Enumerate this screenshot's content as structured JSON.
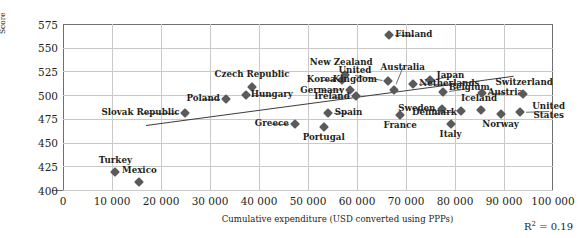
{
  "chart_data": {
    "type": "scatter",
    "title": "",
    "xlabel": "Cumulative expenditure (USD converted using PPPs)",
    "ylabel": "Score",
    "xlim": [
      0,
      100000
    ],
    "ylim": [
      400,
      575
    ],
    "xticks": [
      "0",
      "10 000",
      "20 000",
      "30 000",
      "40 000",
      "50 000",
      "60 000",
      "70 000",
      "80 000",
      "90 000",
      "100 000"
    ],
    "xtick_values": [
      0,
      10000,
      20000,
      30000,
      40000,
      50000,
      60000,
      70000,
      80000,
      90000,
      100000
    ],
    "yticks": [
      "400",
      "425",
      "450",
      "475",
      "500",
      "525",
      "550",
      "575"
    ],
    "ytick_values": [
      400,
      425,
      450,
      475,
      500,
      525,
      550,
      575
    ],
    "grid": true,
    "legend": "none",
    "annotation": "R2 = 0.19",
    "r_squared": 0.19,
    "trendline": {
      "x0": 17000,
      "y0": 468,
      "x1": 92000,
      "y1": 520
    },
    "points": [
      {
        "label": "Turkey",
        "x": 10700,
        "y": 419,
        "label_dx": 0,
        "label_dy": -11
      },
      {
        "label": "Mexico",
        "x": 15600,
        "y": 409,
        "label_dx": 0,
        "label_dy": -11
      },
      {
        "label": "Slovak Republic",
        "x": 24800,
        "y": 481,
        "label_dx": -44,
        "label_dy": 0
      },
      {
        "label": "Poland",
        "x": 33300,
        "y": 496,
        "label_dx": -23,
        "label_dy": 0
      },
      {
        "label": "Czech Republic",
        "x": 38600,
        "y": 509,
        "label_dx": 0,
        "label_dy": -12
      },
      {
        "label": "Hungary",
        "x": 37300,
        "y": 500,
        "label_dx": 26,
        "label_dy": 0
      },
      {
        "label": "Greece",
        "x": 47300,
        "y": 470,
        "label_dx": -23,
        "label_dy": 0
      },
      {
        "label": "Portugal",
        "x": 53200,
        "y": 466,
        "label_dx": 0,
        "label_dy": 11
      },
      {
        "label": "Spain",
        "x": 54000,
        "y": 481,
        "label_dx": 21,
        "label_dy": 0
      },
      {
        "label": "Korea",
        "x": 57000,
        "y": 516,
        "label_dx": -21,
        "label_dy": 0
      },
      {
        "label": "Germany",
        "x": 58600,
        "y": 506,
        "label_dx": -28,
        "label_dy": 1
      },
      {
        "label": "Ireland",
        "x": 59800,
        "y": 499,
        "label_dx": -24,
        "label_dy": 1
      },
      {
        "label": "New Zealand",
        "x": 57600,
        "y": 521,
        "label_dx": -4,
        "label_dy": -12
      },
      {
        "label": "United\nKingdom",
        "x": 66300,
        "y": 515,
        "label_dx": -33,
        "label_dy": -6
      },
      {
        "label": "Australia",
        "x": 67500,
        "y": 506,
        "label_dx": 9,
        "label_dy": -22
      },
      {
        "label": "Finland",
        "x": 66500,
        "y": 563,
        "label_dx": 25,
        "label_dy": 0
      },
      {
        "label": "France",
        "x": 68800,
        "y": 479,
        "label_dx": 0,
        "label_dy": 11
      },
      {
        "label": "Japan",
        "x": 74800,
        "y": 516,
        "label_dx": 21,
        "label_dy": -4
      },
      {
        "label": "Netherlands",
        "x": 71500,
        "y": 512,
        "label_dx": 36,
        "label_dy": 0
      },
      {
        "label": "Belgium",
        "x": 77600,
        "y": 503,
        "label_dx": 26,
        "label_dy": -4
      },
      {
        "label": "Sweden",
        "x": 77300,
        "y": 485,
        "label_dx": -25,
        "label_dy": 0
      },
      {
        "label": "Denmark",
        "x": 81300,
        "y": 483,
        "label_dx": -27,
        "label_dy": 2
      },
      {
        "label": "Italy",
        "x": 79100,
        "y": 470,
        "label_dx": 0,
        "label_dy": 11
      },
      {
        "label": "Iceland",
        "x": 85300,
        "y": 484,
        "label_dx": -2,
        "label_dy": -11
      },
      {
        "label": "Austria",
        "x": 85600,
        "y": 502,
        "label_dx": 23,
        "label_dy": 0
      },
      {
        "label": "Norway",
        "x": 89300,
        "y": 480,
        "label_dx": 0,
        "label_dy": 11
      },
      {
        "label": "Switzerland",
        "x": 93900,
        "y": 501,
        "label_dx": 1,
        "label_dy": -11
      },
      {
        "label": "United\nStates",
        "x": 93200,
        "y": 482,
        "label_dx": 29,
        "label_dy": -1
      }
    ]
  }
}
